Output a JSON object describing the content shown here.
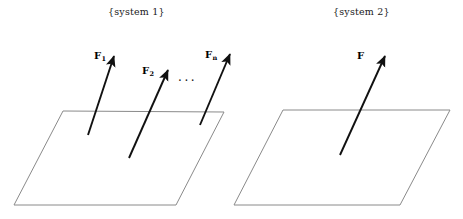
{
  "figure": {
    "width": 463,
    "height": 219,
    "background_color": "#ffffff"
  },
  "captions": {
    "system_1": "{system 1}",
    "system_2": "{system 2}"
  },
  "colors": {
    "plane_stroke": "#8a8a8a",
    "arrow_stroke": "#111111",
    "text": "#1a1a1a",
    "label_text": "#000000",
    "background": "#ffffff"
  },
  "ellipsis": "...",
  "system_1": {
    "caption": "{system 1}",
    "plane": {
      "name": "plane-1",
      "points": "63,111 224,112 176,205 14,205",
      "stroke": "#8a8a8a",
      "stroke_width": 1
    },
    "forces": [
      {
        "name": "force-f1",
        "label": "F",
        "subscript": "1",
        "tail_x": 88,
        "tail_y": 135,
        "tip_x": 114,
        "tip_y": 56
      },
      {
        "name": "force-f2",
        "label": "F",
        "subscript": "2",
        "tail_x": 129,
        "tail_y": 158,
        "tip_x": 168,
        "tip_y": 70
      },
      {
        "name": "force-fn",
        "label": "F",
        "subscript": "n",
        "tail_x": 200,
        "tail_y": 125,
        "tip_x": 230,
        "tip_y": 54
      }
    ]
  },
  "system_2": {
    "caption": "{system 2}",
    "plane": {
      "name": "plane-2",
      "points": "283,110 450,110 400,205 234,205",
      "stroke": "#8a8a8a",
      "stroke_width": 1
    },
    "forces": [
      {
        "name": "force-f",
        "label": "F",
        "subscript": "",
        "tail_x": 340,
        "tail_y": 155,
        "tip_x": 385,
        "tip_y": 56
      }
    ]
  }
}
